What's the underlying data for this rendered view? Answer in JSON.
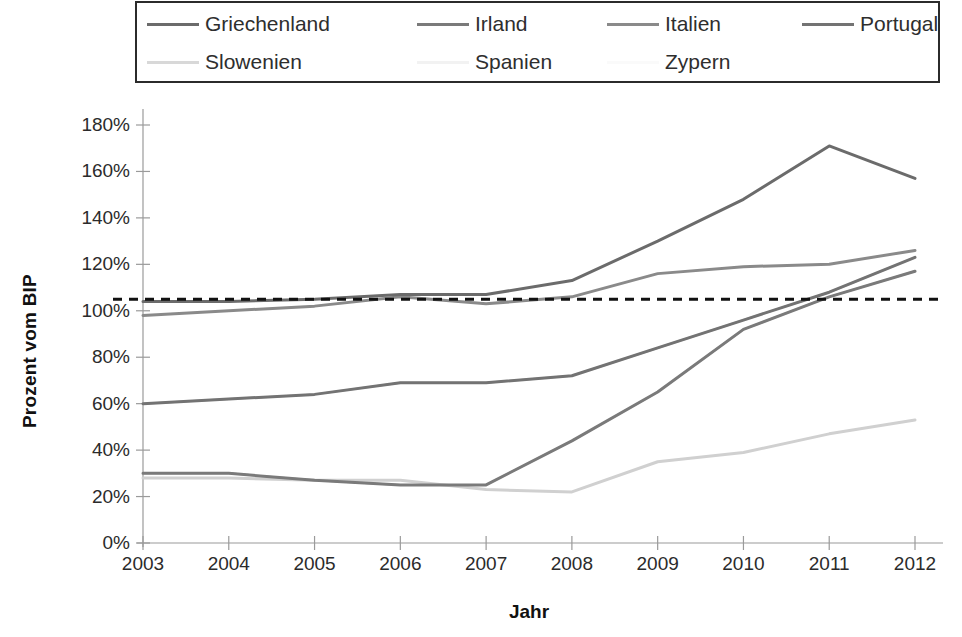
{
  "legend": {
    "items": [
      {
        "label": "Griechenland",
        "color": "#6b6b6b",
        "row": 0,
        "col": 0
      },
      {
        "label": "Irland",
        "color": "#7a7a7a",
        "row": 0,
        "col": 1
      },
      {
        "label": "Italien",
        "color": "#8a8a8a",
        "row": 0,
        "col": 2
      },
      {
        "label": "Portugal",
        "color": "#737373",
        "row": 0,
        "col": 3
      },
      {
        "label": "Slowenien",
        "color": "#d8d8d8",
        "row": 1,
        "col": 0
      },
      {
        "label": "Spanien",
        "color": "#f2f2f2",
        "row": 1,
        "col": 1
      },
      {
        "label": "Zypern",
        "color": "#fafafa",
        "row": 1,
        "col": 2
      }
    ]
  },
  "axes": {
    "y_title": "Prozent vom BIP",
    "x_title": "Jahr",
    "y_ticks": [
      "0%",
      "20%",
      "40%",
      "60%",
      "80%",
      "100%",
      "120%",
      "140%",
      "160%",
      "180%"
    ],
    "x_ticks": [
      "2003",
      "2004",
      "2005",
      "2006",
      "2007",
      "2008",
      "2009",
      "2010",
      "2011",
      "2012"
    ]
  },
  "chart_data": {
    "type": "line",
    "title": "",
    "xlabel": "Jahr",
    "ylabel": "Prozent vom BIP",
    "x": [
      2003,
      2004,
      2005,
      2006,
      2007,
      2008,
      2009,
      2010,
      2011,
      2012
    ],
    "categories": [
      "2003",
      "2004",
      "2005",
      "2006",
      "2007",
      "2008",
      "2009",
      "2010",
      "2011",
      "2012"
    ],
    "ylim": [
      0,
      180
    ],
    "xlim": [
      2003,
      2012
    ],
    "ytick_step": 20,
    "yunit": "%",
    "grid": false,
    "legend_position": "top",
    "reference_line": {
      "label": "",
      "value": 105,
      "style": "dashed",
      "color": "#111111"
    },
    "series": [
      {
        "name": "Griechenland",
        "color": "#6b6b6b",
        "width": 3,
        "values": [
          104,
          104,
          105,
          107,
          107,
          113,
          130,
          148,
          171,
          157
        ]
      },
      {
        "name": "Irland",
        "color": "#7a7a7a",
        "width": 3,
        "values": [
          30,
          30,
          27,
          25,
          25,
          44,
          65,
          92,
          106,
          117
        ]
      },
      {
        "name": "Italien",
        "color": "#8a8a8a",
        "width": 3,
        "values": [
          98,
          100,
          102,
          106,
          103,
          106,
          116,
          119,
          120,
          126
        ]
      },
      {
        "name": "Portugal",
        "color": "#737373",
        "width": 3,
        "values": [
          60,
          62,
          64,
          69,
          69,
          72,
          84,
          96,
          108,
          123
        ]
      },
      {
        "name": "Slowenien",
        "color": "#d0d0d0",
        "width": 3,
        "values": [
          28,
          28,
          27,
          27,
          23,
          22,
          35,
          39,
          47,
          53
        ]
      },
      {
        "name": "Spanien",
        "color": "#bfbfbf",
        "width": 2,
        "values": [
          30,
          30,
          27,
          25,
          25,
          44,
          65,
          92,
          106,
          117
        ]
      },
      {
        "name": "Zypern",
        "color": "#c9c9c9",
        "width": 2,
        "values": [
          60,
          62,
          64,
          69,
          69,
          72,
          84,
          96,
          108,
          123
        ]
      }
    ]
  }
}
